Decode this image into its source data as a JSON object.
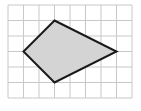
{
  "diagram": {
    "type": "grid-polygon",
    "grid": {
      "columns": 8,
      "rows": 6,
      "origin_px": [
        8,
        5
      ],
      "cell_px": 15.5,
      "line_color": "#c8c8c8",
      "background": "#ffffff"
    },
    "polygon": {
      "shape": "quadrilateral (kite)",
      "vertices_grid": [
        [
          3,
          1
        ],
        [
          7,
          3
        ],
        [
          3,
          5
        ],
        [
          1,
          3
        ]
      ],
      "fill": "#d4d4d4",
      "stroke": "#1a1a1a",
      "stroke_width": 2
    }
  }
}
